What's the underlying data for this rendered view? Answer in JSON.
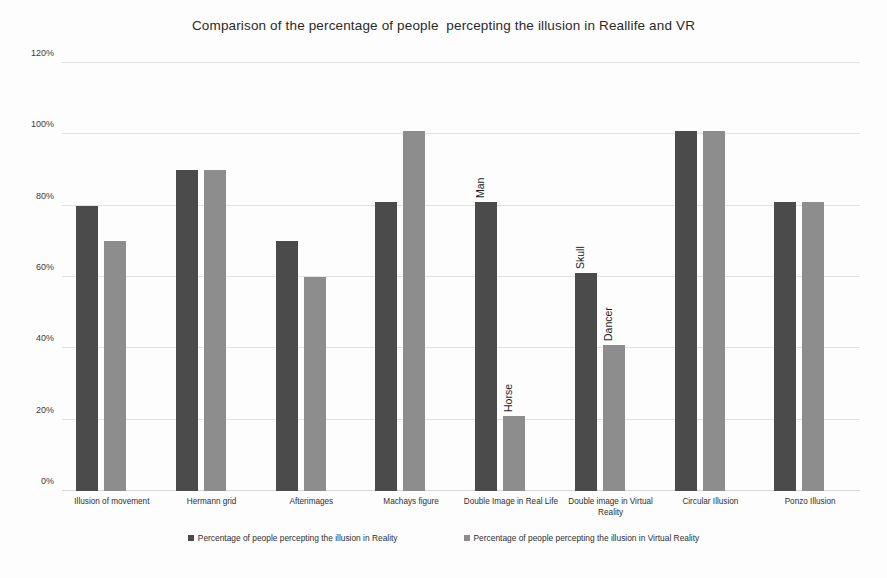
{
  "chart_data": {
    "type": "bar",
    "title": "Comparison of the percentage of people  percepting the illusion in Reallife and VR",
    "xlabel": "",
    "ylabel": "",
    "ylim": [
      0,
      120
    ],
    "ytick_labels": [
      "120%",
      "100%",
      "80%",
      "60%",
      "40%",
      "20%",
      "0%"
    ],
    "ytick_values": [
      120,
      100,
      80,
      60,
      40,
      20,
      0
    ],
    "grid": true,
    "legend_position": "bottom",
    "categories": [
      "Illusion of movement",
      "Hermann grid",
      "Afterimages",
      "Machays figure",
      "Double Image in Real Life",
      "Double image in Virtual Reality",
      "Circular Illusion",
      "Ponzo Illusion"
    ],
    "series": [
      {
        "name": "Percentage of people percepting the illusion in Reality",
        "color": "#4b4b4b",
        "values": [
          80,
          90,
          70,
          81,
          81,
          61,
          101,
          81
        ]
      },
      {
        "name": "Percentage of people percepting the illusion in Virtual Reality",
        "color": "#8d8d8d",
        "values": [
          70,
          90,
          60,
          101,
          21,
          41,
          101,
          81
        ]
      }
    ],
    "annotations": [
      {
        "text": "Man",
        "category_index": 4,
        "series_index": 0,
        "value": 81
      },
      {
        "text": "Horse",
        "category_index": 4,
        "series_index": 1,
        "value": 21
      },
      {
        "text": "Skull",
        "category_index": 5,
        "series_index": 0,
        "value": 61
      },
      {
        "text": "Dancer",
        "category_index": 5,
        "series_index": 1,
        "value": 41
      }
    ]
  }
}
